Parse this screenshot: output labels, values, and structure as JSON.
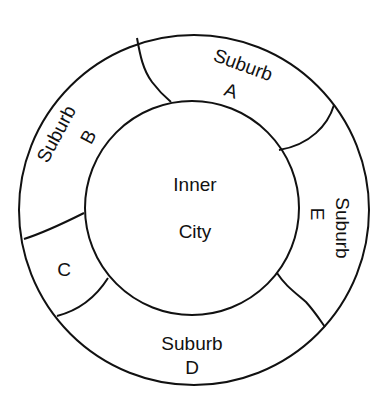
{
  "diagram": {
    "type": "concentric-zone-map",
    "colors": {
      "stroke": "#111111",
      "background": "#ffffff"
    },
    "center": {
      "line1": "Inner",
      "line2": "City"
    },
    "zones": [
      {
        "id": "A",
        "line1": "Suburb",
        "line2": "A"
      },
      {
        "id": "B",
        "line1": "Suburb",
        "line2": "B"
      },
      {
        "id": "C",
        "line1": "C"
      },
      {
        "id": "D",
        "line1": "Suburb",
        "line2": "D"
      },
      {
        "id": "E",
        "line1": "Suburb",
        "line2": "E"
      }
    ]
  }
}
